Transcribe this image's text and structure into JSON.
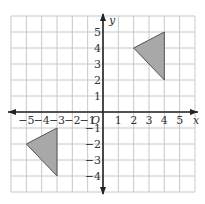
{
  "diagram": {
    "type": "coordinate-plane",
    "x_axis_label": "x",
    "y_axis_label": "y",
    "origin_label": "O",
    "x_range": [
      -6,
      6
    ],
    "y_range": [
      -5,
      6
    ],
    "x_tick_labels": [
      "−5",
      "−4",
      "−3",
      "−2",
      "−1",
      "1",
      "2",
      "3",
      "4",
      "5"
    ],
    "y_tick_labels": [
      "5",
      "4",
      "3",
      "2",
      "1",
      "−1",
      "−2",
      "−3",
      "−4"
    ],
    "colors": {
      "grid": "#c8c8c8",
      "axis": "#222222",
      "triangle_fill": "#a8a8a8",
      "triangle_stroke": "#555555"
    },
    "shapes": [
      {
        "name": "triangle-quadrant-1",
        "vertices": [
          [
            2,
            4
          ],
          [
            4,
            5
          ],
          [
            4,
            2
          ]
        ]
      },
      {
        "name": "triangle-quadrant-3",
        "vertices": [
          [
            -5,
            -2
          ],
          [
            -3,
            -1
          ],
          [
            -3,
            -4
          ]
        ]
      }
    ]
  }
}
